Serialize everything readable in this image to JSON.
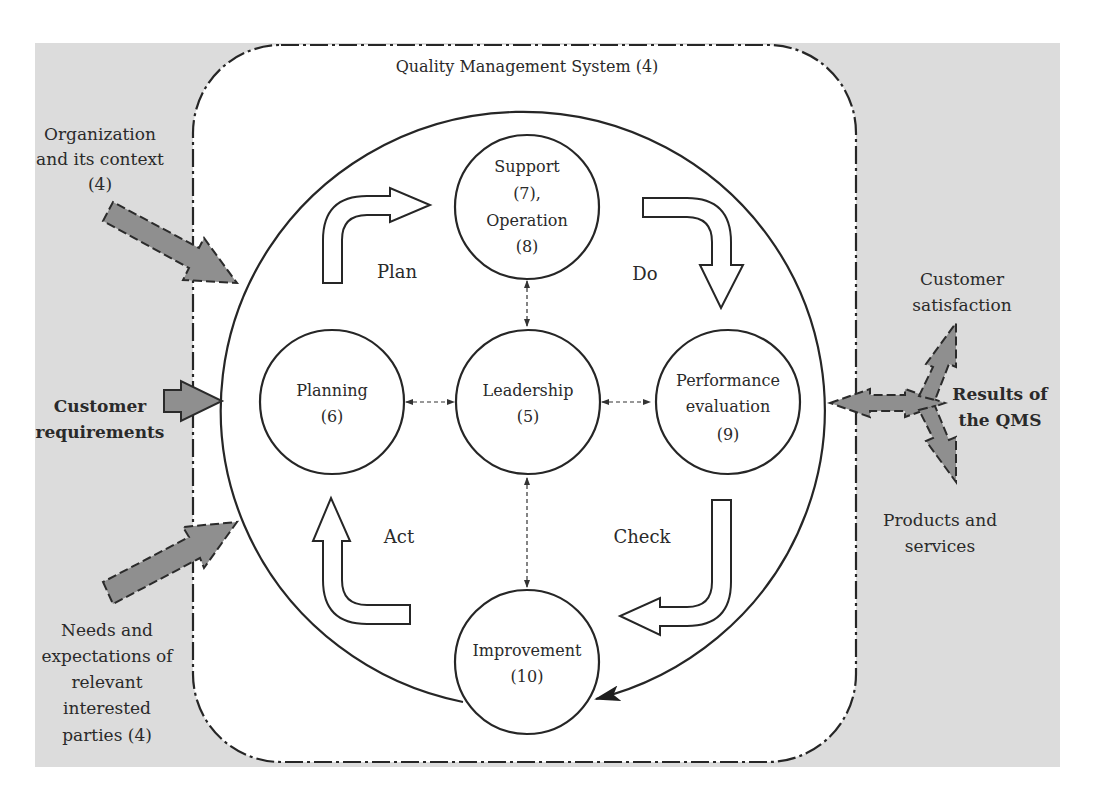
{
  "diagram": {
    "title": "Quality Management System (4)",
    "colors": {
      "background_panel": "#dcdcdc",
      "inner_panel": "#ffffff",
      "input_output_arrow": "#8f8f8f",
      "line": "#262626"
    },
    "inputs": [
      {
        "id": "org-context",
        "lines": [
          "Organization",
          "and its context",
          "(4)"
        ],
        "bold": false
      },
      {
        "id": "customer-requirements",
        "lines": [
          "Customer",
          "requirements"
        ],
        "bold": true
      },
      {
        "id": "needs-expectations",
        "lines": [
          "Needs and",
          "expectations of",
          "relevant",
          "interested",
          "parties (4)"
        ],
        "bold": false
      }
    ],
    "outputs": {
      "results": {
        "lines": [
          "Results of",
          "the QMS"
        ],
        "bold": true
      },
      "customer_satisfaction": {
        "lines": [
          "Customer",
          "satisfaction"
        ]
      },
      "products_services": {
        "lines": [
          "Products and",
          "services"
        ]
      }
    },
    "nodes": [
      {
        "id": "support-operation",
        "lines": [
          "Support",
          "(7),",
          "Operation",
          "(8)"
        ]
      },
      {
        "id": "planning",
        "lines": [
          "Planning",
          "(6)"
        ]
      },
      {
        "id": "leadership",
        "lines": [
          "Leadership",
          "(5)"
        ]
      },
      {
        "id": "performance-evaluation",
        "lines": [
          "Performance",
          "evaluation",
          "(9)"
        ]
      },
      {
        "id": "improvement",
        "lines": [
          "Improvement",
          "(10)"
        ]
      }
    ],
    "pdca": {
      "plan": "Plan",
      "do": "Do",
      "check": "Check",
      "act": "Act"
    },
    "connections": [
      {
        "from": "leadership",
        "to": "planning",
        "style": "dashed-bidirectional"
      },
      {
        "from": "leadership",
        "to": "performance-evaluation",
        "style": "dashed-bidirectional"
      },
      {
        "from": "leadership",
        "to": "support-operation",
        "style": "dashed-bidirectional"
      },
      {
        "from": "leadership",
        "to": "improvement",
        "style": "dashed-bidirectional"
      }
    ]
  }
}
